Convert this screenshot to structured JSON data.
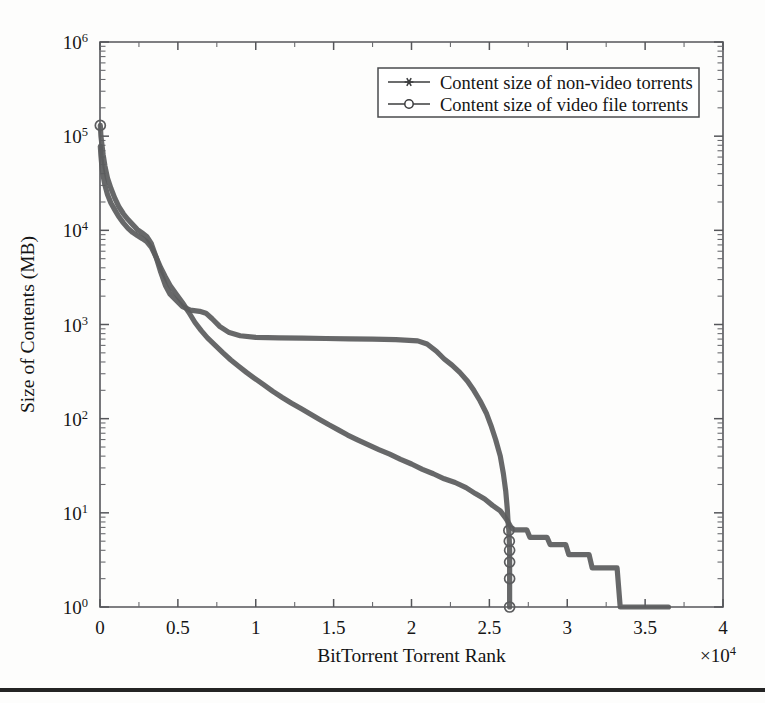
{
  "figure": {
    "width": 765,
    "height": 703,
    "background": "#fdfdfc",
    "rule_color": "#242424"
  },
  "chart_data": {
    "type": "line",
    "title": "",
    "xlabel": "BitTorrent Torrent Rank",
    "ylabel": "Size of Contents (MB)",
    "x_multiplier": "×10⁴",
    "x_multiplier_base": "×10",
    "x_multiplier_exp": "4",
    "xscale": "linear",
    "yscale": "log",
    "xlim": [
      0,
      40000
    ],
    "ylim": [
      1,
      1000000
    ],
    "grid": false,
    "legend_position": "top-right",
    "xticks": [
      0,
      5000,
      10000,
      15000,
      20000,
      25000,
      30000,
      35000,
      40000
    ],
    "xticklabels": [
      "0",
      "0.5",
      "1",
      "1.5",
      "2",
      "2.5",
      "3",
      "3.5",
      "4"
    ],
    "yticks": [
      1,
      10,
      100,
      1000,
      10000,
      100000,
      1000000
    ],
    "yticklabels": [
      "10⁰",
      "10¹",
      "10²",
      "10³",
      "10⁴",
      "10⁵",
      "10⁶"
    ],
    "ytick_bases": [
      "10",
      "10",
      "10",
      "10",
      "10",
      "10",
      "10"
    ],
    "ytick_exps": [
      "0",
      "1",
      "2",
      "3",
      "4",
      "5",
      "6"
    ],
    "series": [
      {
        "name": "Content size of non-video torrents",
        "marker": "star",
        "color": "#5b5c5e",
        "points": [
          [
            20,
            78000
          ],
          [
            60,
            62000
          ],
          [
            120,
            48000
          ],
          [
            200,
            38000
          ],
          [
            320,
            30000
          ],
          [
            480,
            24000
          ],
          [
            700,
            19500
          ],
          [
            950,
            16500
          ],
          [
            1200,
            14000
          ],
          [
            1500,
            12000
          ],
          [
            1800,
            10500
          ],
          [
            2100,
            9500
          ],
          [
            2400,
            8800
          ],
          [
            2700,
            8200
          ],
          [
            3000,
            7600
          ],
          [
            3300,
            6600
          ],
          [
            3600,
            5200
          ],
          [
            3900,
            4000
          ],
          [
            4200,
            3200
          ],
          [
            4500,
            2600
          ],
          [
            4900,
            2100
          ],
          [
            5300,
            1700
          ],
          [
            5700,
            1350
          ],
          [
            6100,
            1050
          ],
          [
            6500,
            860
          ],
          [
            6900,
            720
          ],
          [
            7400,
            600
          ],
          [
            7900,
            500
          ],
          [
            8400,
            420
          ],
          [
            8900,
            360
          ],
          [
            9400,
            310
          ],
          [
            9900,
            270
          ],
          [
            10500,
            230
          ],
          [
            11100,
            195
          ],
          [
            11700,
            168
          ],
          [
            12300,
            146
          ],
          [
            12900,
            128
          ],
          [
            13500,
            112
          ],
          [
            14100,
            98
          ],
          [
            14700,
            86
          ],
          [
            15300,
            76
          ],
          [
            15900,
            67
          ],
          [
            16500,
            60
          ],
          [
            17200,
            53
          ],
          [
            17900,
            47
          ],
          [
            18600,
            42
          ],
          [
            19300,
            37
          ],
          [
            20000,
            33
          ],
          [
            20700,
            29
          ],
          [
            21400,
            26
          ],
          [
            22100,
            23
          ],
          [
            22800,
            21
          ],
          [
            23500,
            18.5
          ],
          [
            24100,
            16
          ],
          [
            24700,
            14
          ],
          [
            25200,
            12
          ],
          [
            25700,
            10.5
          ],
          [
            26000,
            9
          ],
          [
            26200,
            8
          ],
          [
            26400,
            7
          ],
          [
            26600,
            6.6
          ],
          [
            27400,
            6.6
          ],
          [
            27600,
            5.5
          ],
          [
            28700,
            5.5
          ],
          [
            28900,
            4.6
          ],
          [
            29900,
            4.6
          ],
          [
            30100,
            3.6
          ],
          [
            31400,
            3.6
          ],
          [
            31600,
            2.6
          ],
          [
            33200,
            2.6
          ],
          [
            33400,
            1.0
          ],
          [
            36500,
            1.0
          ]
        ]
      },
      {
        "name": "Content size of video file torrents",
        "marker": "circle",
        "color": "#5b5c5e",
        "points": [
          [
            20,
            130000
          ],
          [
            60,
            100000
          ],
          [
            120,
            82000
          ],
          [
            200,
            64000
          ],
          [
            320,
            48000
          ],
          [
            480,
            36000
          ],
          [
            700,
            28000
          ],
          [
            950,
            22000
          ],
          [
            1200,
            18000
          ],
          [
            1500,
            15000
          ],
          [
            1800,
            13000
          ],
          [
            2100,
            11500
          ],
          [
            2400,
            10200
          ],
          [
            2700,
            9400
          ],
          [
            3000,
            8600
          ],
          [
            3300,
            7200
          ],
          [
            3600,
            5200
          ],
          [
            3900,
            3600
          ],
          [
            4200,
            2600
          ],
          [
            4500,
            2100
          ],
          [
            4900,
            1800
          ],
          [
            5300,
            1550
          ],
          [
            5800,
            1420
          ],
          [
            6400,
            1380
          ],
          [
            6800,
            1320
          ],
          [
            7200,
            1150
          ],
          [
            7700,
            950
          ],
          [
            8300,
            820
          ],
          [
            9000,
            760
          ],
          [
            10000,
            730
          ],
          [
            11500,
            720
          ],
          [
            13000,
            715
          ],
          [
            14500,
            710
          ],
          [
            16000,
            705
          ],
          [
            17500,
            700
          ],
          [
            19000,
            690
          ],
          [
            20400,
            670
          ],
          [
            21000,
            620
          ],
          [
            21600,
            520
          ],
          [
            22100,
            430
          ],
          [
            22600,
            370
          ],
          [
            23100,
            310
          ],
          [
            23600,
            250
          ],
          [
            24000,
            200
          ],
          [
            24400,
            155
          ],
          [
            24800,
            115
          ],
          [
            25100,
            85
          ],
          [
            25400,
            60
          ],
          [
            25700,
            40
          ],
          [
            25900,
            26
          ],
          [
            26050,
            17
          ],
          [
            26150,
            11
          ],
          [
            26200,
            8
          ],
          [
            26250,
            6.5
          ],
          [
            26280,
            5
          ],
          [
            26300,
            4
          ],
          [
            26300,
            3
          ],
          [
            26300,
            2
          ],
          [
            26300,
            1.3
          ],
          [
            26300,
            1.0
          ]
        ],
        "marker_points": [
          [
            20,
            130000
          ],
          [
            26250,
            6.5
          ],
          [
            26280,
            5
          ],
          [
            26300,
            4
          ],
          [
            26300,
            3
          ],
          [
            26300,
            2
          ],
          [
            26300,
            1.0
          ]
        ]
      }
    ]
  },
  "legend": {
    "entries": [
      {
        "label": "Content size of non-video torrents",
        "marker": "star"
      },
      {
        "label": "Content size of video file torrents",
        "marker": "circle"
      }
    ]
  }
}
